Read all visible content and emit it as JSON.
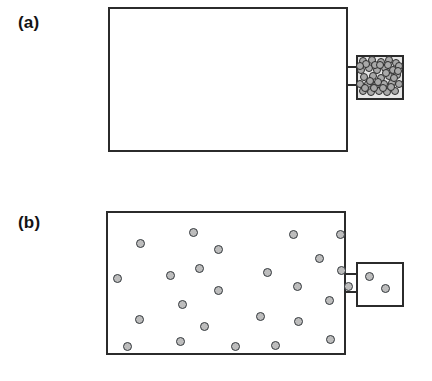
{
  "figure": {
    "background_color": "#ffffff",
    "line_color": "#2b2b2b",
    "particle_fill": "#b9b9b9",
    "particle_stroke": "#2f2f2f",
    "dense_box_fill": "#e6e6e6",
    "width": 432,
    "height": 381
  },
  "panels": [
    {
      "id": "a",
      "label": "(a)",
      "description": "Large chamber empty; all gas particles compressed in the small side chamber",
      "main_chamber": {
        "name": "large-chamber",
        "x": 108,
        "y": 7,
        "width": 240,
        "height": 145,
        "particle_count": 0,
        "particles": []
      },
      "side_chamber": {
        "name": "small-chamber-dense",
        "x": 356,
        "y": 55,
        "width": 48,
        "height": 45,
        "filled": true,
        "particle_count": 41,
        "particles": [
          {
            "x": 5,
            "y": 4
          },
          {
            "x": 14,
            "y": 3
          },
          {
            "x": 23,
            "y": 5
          },
          {
            "x": 31,
            "y": 3
          },
          {
            "x": 38,
            "y": 6
          },
          {
            "x": 3,
            "y": 13
          },
          {
            "x": 11,
            "y": 11
          },
          {
            "x": 19,
            "y": 13
          },
          {
            "x": 27,
            "y": 11
          },
          {
            "x": 35,
            "y": 13
          },
          {
            "x": 41,
            "y": 9
          },
          {
            "x": 6,
            "y": 20
          },
          {
            "x": 15,
            "y": 19
          },
          {
            "x": 23,
            "y": 21
          },
          {
            "x": 31,
            "y": 19
          },
          {
            "x": 39,
            "y": 18
          },
          {
            "x": 2,
            "y": 27
          },
          {
            "x": 10,
            "y": 27
          },
          {
            "x": 18,
            "y": 28
          },
          {
            "x": 26,
            "y": 27
          },
          {
            "x": 34,
            "y": 26
          },
          {
            "x": 41,
            "y": 27
          },
          {
            "x": 5,
            "y": 34
          },
          {
            "x": 13,
            "y": 35
          },
          {
            "x": 21,
            "y": 34
          },
          {
            "x": 29,
            "y": 35
          },
          {
            "x": 37,
            "y": 34
          },
          {
            "x": 8,
            "y": 7
          },
          {
            "x": 17,
            "y": 8
          },
          {
            "x": 28,
            "y": 16
          },
          {
            "x": 36,
            "y": 21
          },
          {
            "x": 12,
            "y": 24
          },
          {
            "x": 22,
            "y": 8
          },
          {
            "x": 7,
            "y": 31
          },
          {
            "x": 25,
            "y": 31
          },
          {
            "x": 33,
            "y": 30
          },
          {
            "x": 40,
            "y": 14
          },
          {
            "x": 16,
            "y": 31
          },
          {
            "x": 30,
            "y": 8
          },
          {
            "x": 2,
            "y": 9
          },
          {
            "x": 20,
            "y": 25
          }
        ]
      },
      "neck": {
        "name": "connector-neck",
        "x": 348,
        "y": 66,
        "length": 8,
        "gap": 18
      }
    },
    {
      "id": "b",
      "label": "(b)",
      "description": "Gas particles expanded and dispersed throughout the large chamber, a few remain in the small side chamber",
      "main_chamber": {
        "name": "large-chamber",
        "x": 106,
        "y": 211,
        "width": 240,
        "height": 144,
        "particle_count": 25,
        "particles": [
          {
            "x": 85,
            "y": 19
          },
          {
            "x": 185,
            "y": 21
          },
          {
            "x": 232,
            "y": 21
          },
          {
            "x": 32,
            "y": 30
          },
          {
            "x": 110,
            "y": 36
          },
          {
            "x": 211,
            "y": 45
          },
          {
            "x": 9,
            "y": 65
          },
          {
            "x": 62,
            "y": 62
          },
          {
            "x": 91,
            "y": 55
          },
          {
            "x": 159,
            "y": 59
          },
          {
            "x": 233,
            "y": 57
          },
          {
            "x": 110,
            "y": 77
          },
          {
            "x": 189,
            "y": 73
          },
          {
            "x": 74,
            "y": 91
          },
          {
            "x": 221,
            "y": 87
          },
          {
            "x": 31,
            "y": 106
          },
          {
            "x": 96,
            "y": 113
          },
          {
            "x": 152,
            "y": 103
          },
          {
            "x": 190,
            "y": 108
          },
          {
            "x": 19,
            "y": 133
          },
          {
            "x": 72,
            "y": 128
          },
          {
            "x": 127,
            "y": 133
          },
          {
            "x": 167,
            "y": 132
          },
          {
            "x": 222,
            "y": 126
          },
          {
            "x": 240,
            "y": 73
          }
        ]
      },
      "side_chamber": {
        "name": "small-chamber-sparse",
        "x": 356,
        "y": 262,
        "width": 48,
        "height": 45,
        "filled": false,
        "particle_count": 2,
        "particles": [
          {
            "x": 11,
            "y": 12
          },
          {
            "x": 27,
            "y": 24
          }
        ]
      },
      "neck": {
        "name": "connector-neck",
        "x": 346,
        "y": 273,
        "length": 10,
        "gap": 18
      }
    }
  ]
}
